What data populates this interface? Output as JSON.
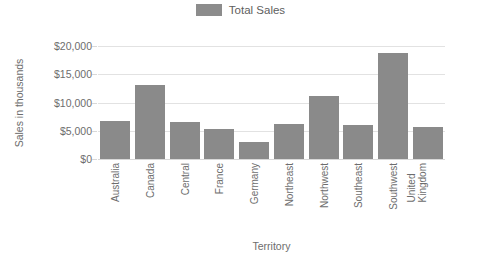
{
  "legend": {
    "swatch_color": "#8c8c8c",
    "entries": [
      {
        "label": "Total Sales",
        "color": "#8c8c8c"
      }
    ]
  },
  "axes": {
    "y_title": "Sales in thousands",
    "x_title": "Territory"
  },
  "chart_data": {
    "type": "bar",
    "title": "",
    "subtitle": "",
    "xlabel": "Territory",
    "ylabel": "Sales in thousands",
    "categories": [
      "Australia",
      "Canada",
      "Central",
      "France",
      "Germany",
      "Northeast",
      "Northwest",
      "Southeast",
      "Southwest",
      "United Kingdom"
    ],
    "series": [
      {
        "name": "Total Sales",
        "color": "#8a8a8a",
        "values": [
          6700,
          13100,
          6600,
          5400,
          3100,
          6200,
          11200,
          6100,
          18700,
          5600
        ]
      }
    ],
    "values": [
      6700,
      13100,
      6600,
      5400,
      3100,
      6200,
      11200,
      6100,
      18700,
      5600
    ],
    "ylim": [
      0,
      20000
    ],
    "ytick_values": [
      0,
      5000,
      10000,
      15000,
      20000
    ],
    "ytick_labels": [
      "$0",
      "$5,000",
      "$10,000",
      "$15,000",
      "$20,000"
    ],
    "grid": true,
    "grid_axis": "y",
    "legend_position": "top-center",
    "bar_color": "#8a8a8a",
    "background": "#ffffff"
  }
}
